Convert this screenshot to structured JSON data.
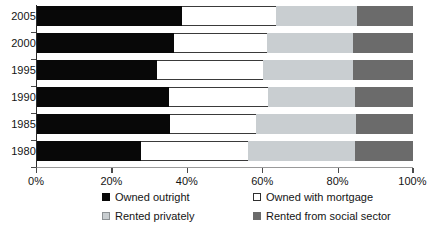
{
  "chart_data": {
    "type": "bar",
    "orientation": "horizontal",
    "stacked": true,
    "stack_total": 100,
    "title": "",
    "xlabel": "",
    "ylabel": "",
    "xlim": [
      0,
      100
    ],
    "grid": false,
    "legend_position": "bottom",
    "categories": [
      "2005",
      "2000",
      "1995",
      "1990",
      "1985",
      "1980"
    ],
    "category_order_top_to_bottom": [
      "2005",
      "2000",
      "1995",
      "1990",
      "1985",
      "1980"
    ],
    "x_tick_labels": [
      "0%",
      "20%",
      "40%",
      "60%",
      "80%",
      "100%"
    ],
    "x_tick_values": [
      0,
      20,
      40,
      60,
      80,
      100
    ],
    "series": [
      {
        "name": "Owned outright",
        "color": "#080808",
        "values": [
          38.6,
          36.6,
          32.2,
          35.4,
          35.5,
          27.8
        ]
      },
      {
        "name": "Owned with mortgage",
        "color": "#ffffff",
        "values": [
          25.1,
          24.7,
          28.1,
          26.2,
          22.9,
          28.5
        ]
      },
      {
        "name": "Rented privately",
        "color": "#c9ced1",
        "values": [
          21.5,
          22.7,
          23.9,
          23.0,
          26.5,
          28.3
        ]
      },
      {
        "name": "Rented from social sector",
        "color": "#6b6b6b",
        "values": [
          14.8,
          16.0,
          15.8,
          15.4,
          15.1,
          15.4
        ]
      }
    ],
    "cumulative_boundaries": {
      "2005": [
        38.6,
        63.7,
        85.2,
        100
      ],
      "2000": [
        36.6,
        61.3,
        84.0,
        100
      ],
      "1995": [
        32.2,
        60.3,
        84.2,
        100
      ],
      "1990": [
        35.4,
        61.6,
        84.6,
        100
      ],
      "1985": [
        35.5,
        58.4,
        84.9,
        100
      ],
      "1980": [
        27.8,
        56.3,
        84.6,
        100
      ]
    }
  },
  "axes": {
    "y_labels": [
      {
        "label": "2005"
      },
      {
        "label": "2000"
      },
      {
        "label": "1995"
      },
      {
        "label": "1990"
      },
      {
        "label": "1985"
      },
      {
        "label": "1980"
      }
    ],
    "x_labels": [
      {
        "label": "0%",
        "value": 0
      },
      {
        "label": "20%",
        "value": 20
      },
      {
        "label": "40%",
        "value": 40
      },
      {
        "label": "60%",
        "value": 60
      },
      {
        "label": "80%",
        "value": 80
      },
      {
        "label": "100%",
        "value": 100
      }
    ]
  },
  "legend": {
    "items": [
      {
        "label": "Owned outright",
        "swatch": "owned-outright"
      },
      {
        "label": "Owned with mortgage",
        "swatch": "owned-mortgage"
      },
      {
        "label": "Rented privately",
        "swatch": "rented-privately"
      },
      {
        "label": "Rented from social sector",
        "swatch": "rented-social"
      }
    ]
  },
  "colors": {
    "owned_outright": "#080808",
    "owned_with_mortgage": "#ffffff",
    "rented_privately": "#c9ced1",
    "rented_from_social_sector": "#6b6b6b",
    "axis": "#4a4a4a",
    "text": "#141414",
    "background": "#ffffff"
  }
}
